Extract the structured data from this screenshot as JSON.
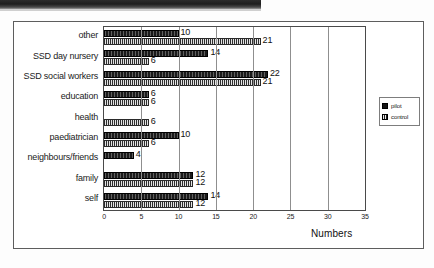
{
  "chart_data": {
    "type": "bar",
    "orientation": "horizontal",
    "title": "",
    "xlabel": "Numbers",
    "ylabel": "",
    "xlim": [
      0,
      35
    ],
    "xticks": [
      0,
      5,
      10,
      15,
      20,
      25,
      30,
      35
    ],
    "grid": true,
    "grid_axis": "x",
    "legend_position": "right",
    "categories": [
      "other",
      "SSD day nursery",
      "SSD social workers",
      "education",
      "health",
      "paediatrician",
      "neighbours/friends",
      "family",
      "self"
    ],
    "series": [
      {
        "name": "pilot",
        "color": "#1a1a1a",
        "values": [
          10,
          14,
          22,
          6,
          0,
          10,
          4,
          12,
          14
        ]
      },
      {
        "name": "control",
        "color": "#8e8e8e",
        "values": [
          21,
          6,
          21,
          6,
          6,
          6,
          0,
          12,
          12
        ]
      }
    ],
    "data_labels": {
      "other": {
        "pilot": "10",
        "control": "21"
      },
      "SSD day nursery": {
        "pilot": "14",
        "control": "6"
      },
      "SSD social workers": {
        "pilot": "22",
        "control": "21"
      },
      "education": {
        "pilot": "6",
        "control": "6"
      },
      "health": {
        "pilot": "",
        "control": "6"
      },
      "paediatrician": {
        "pilot": "10",
        "control": "6"
      },
      "neighbours/friends": {
        "pilot": "4",
        "control": ""
      },
      "family": {
        "pilot": "12",
        "control": "12"
      },
      "self": {
        "pilot": "14",
        "control": "12"
      }
    }
  },
  "legend": {
    "items": [
      {
        "label": "pilot"
      },
      {
        "label": "control"
      }
    ]
  },
  "axis": {
    "title": "Numbers",
    "tick_labels": [
      "0",
      "5",
      "10",
      "15",
      "20",
      "25",
      "30",
      "35"
    ]
  }
}
